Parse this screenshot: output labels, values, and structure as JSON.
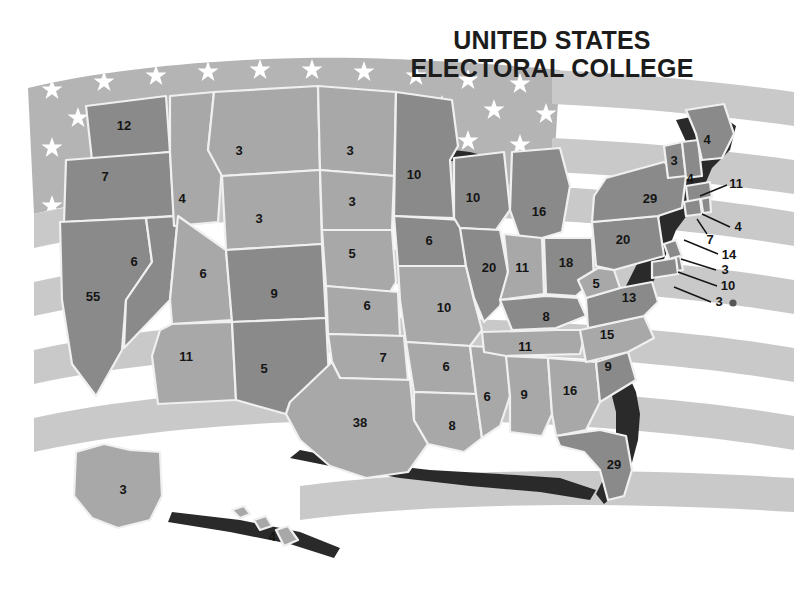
{
  "title": {
    "line1": "UNITED STATES",
    "line2": "ELECTORAL COLLEGE"
  },
  "colors": {
    "background": "#ffffff",
    "flag_canton": "#b4b4b4",
    "flag_star": "#ffffff",
    "flag_stripe": "#c9c9c9",
    "state_dark": "#8a8a8a",
    "state_light": "#a8a8a8",
    "state_border": "#f0f0f0",
    "coast_shadow": "#2a2a2a",
    "label_text": "#151515",
    "title_text": "#1c1c1c"
  },
  "chart_data": {
    "type": "map",
    "title": "UNITED STATES ELECTORAL COLLEGE",
    "unit": "electoral votes",
    "total": 538,
    "categories": [
      "AL",
      "AK",
      "AZ",
      "AR",
      "CA",
      "CO",
      "CT",
      "DE",
      "DC",
      "FL",
      "GA",
      "HI",
      "ID",
      "IL",
      "IN",
      "IA",
      "KS",
      "KY",
      "LA",
      "ME",
      "MD",
      "MA",
      "MI",
      "MN",
      "MS",
      "MO",
      "MT",
      "NE",
      "NV",
      "NH",
      "NJ",
      "NM",
      "NY",
      "NC",
      "ND",
      "OH",
      "OK",
      "OR",
      "PA",
      "RI",
      "SC",
      "SD",
      "TN",
      "TX",
      "UT",
      "VT",
      "VA",
      "WA",
      "WV",
      "WI",
      "WY"
    ],
    "values": [
      9,
      3,
      11,
      6,
      55,
      9,
      7,
      3,
      3,
      29,
      16,
      4,
      4,
      20,
      11,
      6,
      6,
      8,
      8,
      4,
      10,
      11,
      16,
      10,
      6,
      10,
      3,
      5,
      6,
      4,
      14,
      5,
      29,
      15,
      3,
      18,
      7,
      7,
      20,
      4,
      9,
      3,
      11,
      38,
      6,
      3,
      13,
      12,
      5,
      10,
      3
    ],
    "legend": [],
    "grid": false
  },
  "states": [
    {
      "code": "WA",
      "name": "Washington",
      "votes": "12",
      "shade": "dark",
      "x": 124,
      "y": 127
    },
    {
      "code": "OR",
      "name": "Oregon",
      "votes": "7",
      "shade": "dark",
      "x": 105,
      "y": 178
    },
    {
      "code": "CA",
      "name": "California",
      "votes": "55",
      "shade": "dark",
      "x": 93,
      "y": 298
    },
    {
      "code": "NV",
      "name": "Nevada",
      "votes": "6",
      "shade": "dark",
      "x": 134,
      "y": 263
    },
    {
      "code": "ID",
      "name": "Idaho",
      "votes": "4",
      "shade": "light",
      "x": 182,
      "y": 200
    },
    {
      "code": "MT",
      "name": "Montana",
      "votes": "3",
      "shade": "light",
      "x": 239,
      "y": 152
    },
    {
      "code": "WY",
      "name": "Wyoming",
      "votes": "3",
      "shade": "light",
      "x": 259,
      "y": 220
    },
    {
      "code": "UT",
      "name": "Utah",
      "votes": "6",
      "shade": "light",
      "x": 203,
      "y": 275
    },
    {
      "code": "CO",
      "name": "Colorado",
      "votes": "9",
      "shade": "dark",
      "x": 274,
      "y": 295
    },
    {
      "code": "AZ",
      "name": "Arizona",
      "votes": "11",
      "shade": "light",
      "x": 186,
      "y": 358
    },
    {
      "code": "NM",
      "name": "New Mexico",
      "votes": "5",
      "shade": "dark",
      "x": 264,
      "y": 370
    },
    {
      "code": "ND",
      "name": "North Dakota",
      "votes": "3",
      "shade": "light",
      "x": 350,
      "y": 152
    },
    {
      "code": "SD",
      "name": "South Dakota",
      "votes": "3",
      "shade": "light",
      "x": 352,
      "y": 203
    },
    {
      "code": "NE",
      "name": "Nebraska",
      "votes": "5",
      "shade": "light",
      "x": 352,
      "y": 255
    },
    {
      "code": "KS",
      "name": "Kansas",
      "votes": "6",
      "shade": "light",
      "x": 367,
      "y": 307
    },
    {
      "code": "OK",
      "name": "Oklahoma",
      "votes": "7",
      "shade": "light",
      "x": 383,
      "y": 359
    },
    {
      "code": "TX",
      "name": "Texas",
      "votes": "38",
      "shade": "light",
      "x": 360,
      "y": 424
    },
    {
      "code": "MN",
      "name": "Minnesota",
      "votes": "10",
      "shade": "dark",
      "x": 414,
      "y": 176
    },
    {
      "code": "IA",
      "name": "Iowa",
      "votes": "6",
      "shade": "dark",
      "x": 429,
      "y": 242
    },
    {
      "code": "MO",
      "name": "Missouri",
      "votes": "10",
      "shade": "light",
      "x": 444,
      "y": 309
    },
    {
      "code": "AR",
      "name": "Arkansas",
      "votes": "6",
      "shade": "light",
      "x": 446,
      "y": 368
    },
    {
      "code": "LA",
      "name": "Louisiana",
      "votes": "8",
      "shade": "light",
      "x": 452,
      "y": 427
    },
    {
      "code": "WI",
      "name": "Wisconsin",
      "votes": "10",
      "shade": "dark",
      "x": 473,
      "y": 199
    },
    {
      "code": "IL",
      "name": "Illinois",
      "votes": "20",
      "shade": "dark",
      "x": 489,
      "y": 269
    },
    {
      "code": "MS",
      "name": "Mississippi",
      "votes": "6",
      "shade": "light",
      "x": 487,
      "y": 398
    },
    {
      "code": "MI",
      "name": "Michigan",
      "votes": "16",
      "shade": "dark",
      "x": 539,
      "y": 213
    },
    {
      "code": "IN",
      "name": "Indiana",
      "votes": "11",
      "shade": "light",
      "x": 522,
      "y": 269
    },
    {
      "code": "OH",
      "name": "Ohio",
      "votes": "18",
      "shade": "dark",
      "x": 566,
      "y": 264
    },
    {
      "code": "KY",
      "name": "Kentucky",
      "votes": "8",
      "shade": "dark",
      "x": 546,
      "y": 318
    },
    {
      "code": "TN",
      "name": "Tennessee",
      "votes": "11",
      "shade": "light",
      "x": 525,
      "y": 348
    },
    {
      "code": "AL",
      "name": "Alabama",
      "votes": "9",
      "shade": "light",
      "x": 524,
      "y": 396
    },
    {
      "code": "GA",
      "name": "Georgia",
      "votes": "16",
      "shade": "light",
      "x": 570,
      "y": 392
    },
    {
      "code": "FL",
      "name": "Florida",
      "votes": "29",
      "shade": "dark",
      "x": 614,
      "y": 466
    },
    {
      "code": "SC",
      "name": "South Carolina",
      "votes": "9",
      "shade": "dark",
      "x": 608,
      "y": 368
    },
    {
      "code": "NC",
      "name": "North Carolina",
      "votes": "15",
      "shade": "light",
      "x": 607,
      "y": 336
    },
    {
      "code": "VA",
      "name": "Virginia",
      "votes": "13",
      "shade": "dark",
      "x": 629,
      "y": 299
    },
    {
      "code": "WV",
      "name": "West Virginia",
      "votes": "5",
      "shade": "light",
      "x": 596,
      "y": 285
    },
    {
      "code": "PA",
      "name": "Pennsylvania",
      "votes": "20",
      "shade": "dark",
      "x": 623,
      "y": 241
    },
    {
      "code": "NY",
      "name": "New York",
      "votes": "29",
      "shade": "dark",
      "x": 650,
      "y": 200
    },
    {
      "code": "VT",
      "name": "Vermont",
      "votes": "3",
      "shade": "dark",
      "x": 674,
      "y": 162
    },
    {
      "code": "NH",
      "name": "New Hampshire",
      "votes": "4",
      "shade": "dark",
      "x": 690,
      "y": 180
    },
    {
      "code": "ME",
      "name": "Maine",
      "votes": "4",
      "shade": "dark",
      "x": 707,
      "y": 141
    },
    {
      "code": "AK",
      "name": "Alaska",
      "votes": "3",
      "shade": "light",
      "x": 123,
      "y": 491
    },
    {
      "code": "HI",
      "name": "Hawaii",
      "votes": "4",
      "shade": "light",
      "x": 272,
      "y": 538
    }
  ],
  "callouts": [
    {
      "code": "MA",
      "name": "Massachusetts",
      "votes": "11",
      "lx": 736,
      "ly": 185,
      "x1": 727,
      "y1": 185,
      "x2": 700,
      "y2": 196
    },
    {
      "code": "RI",
      "name": "Rhode Island",
      "votes": "4",
      "lx": 738,
      "ly": 228,
      "x1": 730,
      "y1": 227,
      "x2": 702,
      "y2": 214
    },
    {
      "code": "CT",
      "name": "Connecticut",
      "votes": "7",
      "lx": 710,
      "ly": 241,
      "x1": 707,
      "y1": 234,
      "x2": 697,
      "y2": 219
    },
    {
      "code": "NJ",
      "name": "New Jersey",
      "votes": "14",
      "lx": 729,
      "ly": 256,
      "x1": 718,
      "y1": 254,
      "x2": 684,
      "y2": 240
    },
    {
      "code": "DE",
      "name": "Delaware",
      "votes": "3",
      "lx": 725,
      "ly": 271,
      "x1": 716,
      "y1": 270,
      "x2": 681,
      "y2": 259
    },
    {
      "code": "MD",
      "name": "Maryland",
      "votes": "10",
      "lx": 728,
      "ly": 287,
      "x1": 717,
      "y1": 286,
      "x2": 678,
      "y2": 272
    },
    {
      "code": "DC",
      "name": "District of Columbia",
      "votes": "3",
      "lx": 719,
      "ly": 303,
      "x1": 711,
      "y1": 302,
      "x2": 674,
      "y2": 287,
      "dot": true,
      "dotx": 733,
      "doty": 303
    }
  ]
}
